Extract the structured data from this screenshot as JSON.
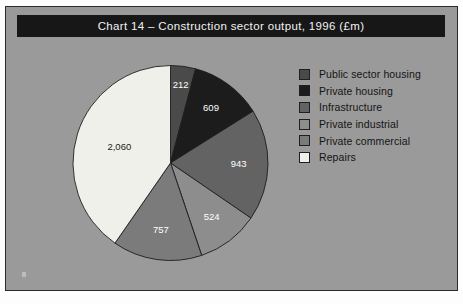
{
  "chart": {
    "title": "Chart 14 – Construction sector output, 1996 (£m)",
    "title_bg": "#171717",
    "title_color": "#f2f2f2",
    "panel_bg": "#9a9a9a",
    "frame_border": "#2b2b2b"
  },
  "legend": {
    "items": [
      {
        "label": "Public sector housing",
        "color": "#4a4a4a"
      },
      {
        "label": "Private housing",
        "color": "#1c1c1c"
      },
      {
        "label": "Infrastructure",
        "color": "#636363"
      },
      {
        "label": "Private industrial",
        "color": "#8d8d8d"
      },
      {
        "label": "Private commercial",
        "color": "#7b7b7b"
      },
      {
        "label": "Repairs",
        "color": "#f0f0ea"
      }
    ]
  },
  "footer": {
    "artifact_text": ""
  },
  "chart_data": {
    "type": "pie",
    "title": "Chart 14 – Construction sector output, 1996 (£m)",
    "unit": "£m",
    "total": 5105,
    "start_angle_deg": 0,
    "direction": "clockwise",
    "legend_position": "right",
    "categories": [
      "Public sector housing",
      "Private housing",
      "Infrastructure",
      "Private industrial",
      "Private commercial",
      "Repairs"
    ],
    "values": [
      212,
      609,
      943,
      524,
      757,
      2060
    ],
    "labels": [
      "212",
      "609",
      "943",
      "524",
      "757",
      "2,060"
    ],
    "colors": [
      "#4a4a4a",
      "#1c1c1c",
      "#636363",
      "#8d8d8d",
      "#7b7b7b",
      "#f0f0ea"
    ],
    "label_colors": [
      "#ffffff",
      "#ffffff",
      "#ffffff",
      "#ffffff",
      "#ffffff",
      "#1a1a1a"
    ],
    "slice_angles_deg": [
      14.95,
      42.95,
      66.51,
      36.96,
      53.39,
      145.24
    ],
    "percentages": [
      4.2,
      11.9,
      18.5,
      10.3,
      14.8,
      40.4
    ]
  }
}
